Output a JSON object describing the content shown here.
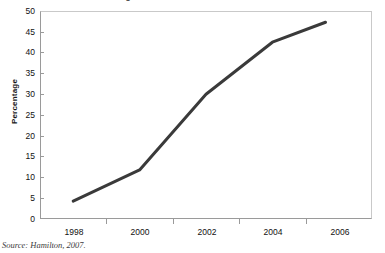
{
  "figure": {
    "title_clipped": "Percentage of households with broadband access",
    "ylabel": "Percentage",
    "source_note": "Source: Hamilton, 2007.",
    "line_color": "#3a3a3a",
    "frame_color": "#9a9a9a",
    "text_color": "#111111"
  },
  "chart_data": {
    "type": "line",
    "title": "Percentage of households with broadband access",
    "xlabel": "",
    "ylabel": "Percentage",
    "x": [
      1998,
      2000,
      2002,
      2004,
      2005.6
    ],
    "values": [
      4.3,
      11.8,
      30.0,
      42.5,
      47.3
    ],
    "series": [
      {
        "name": "Percentage",
        "values": [
          4.3,
          11.8,
          30.0,
          42.5,
          47.3
        ]
      }
    ],
    "xlim": [
      1997,
      2007
    ],
    "ylim": [
      0,
      50
    ],
    "ytick_labels": [
      "0",
      "5",
      "10",
      "15",
      "20",
      "25",
      "30",
      "35",
      "40",
      "45",
      "50"
    ],
    "ytick_values": [
      0,
      5,
      10,
      15,
      20,
      25,
      30,
      35,
      40,
      45,
      50
    ],
    "xtick_labels": [
      "1998",
      "2000",
      "2002",
      "2004",
      "2006"
    ],
    "xtick_values": [
      1998,
      2000,
      2002,
      2004,
      2006
    ],
    "grid": false,
    "legend": "none",
    "annotations": [
      "Source: Hamilton, 2007."
    ]
  }
}
